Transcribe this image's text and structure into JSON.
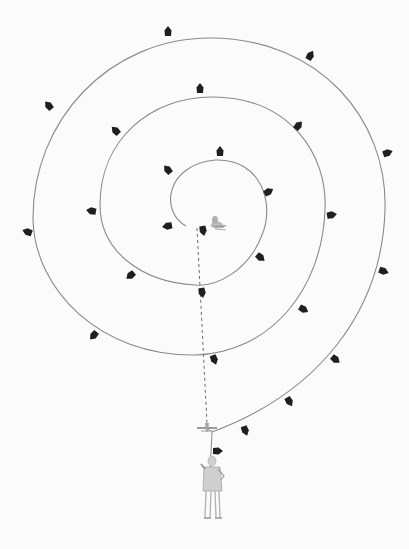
{
  "colors": {
    "background": "#fbfbfb",
    "spiral_line": "#8a8a8a",
    "marker": "#1f1f1f",
    "dotted_line": "#6a6a6a",
    "figure": "#b9b9b9",
    "bird": "#a8a8a8"
  },
  "spiral": {
    "path": "M 186 226 C 160 212, 165 165, 215 160 C 262 158, 275 205, 262 235 C 248 272, 215 287, 195 285 C 140 282, 100 250, 100 205 C 100 140, 150 97, 212 97 C 290 97, 328 155, 325 210 C 322 290, 270 353, 195 355 C 100 356, 35 290, 33 220 C 32 120, 110 38, 210 38 C 320 38, 388 120, 385 210 C 382 310, 320 392, 212 432"
  },
  "markers": [
    {
      "x": 168,
      "y": 32,
      "r": 0
    },
    {
      "x": 310,
      "y": 56,
      "r": 30
    },
    {
      "x": 49,
      "y": 106,
      "r": -40
    },
    {
      "x": 200,
      "y": 89,
      "r": 0
    },
    {
      "x": 116,
      "y": 131,
      "r": -45
    },
    {
      "x": 298,
      "y": 126,
      "r": 40
    },
    {
      "x": 387,
      "y": 153,
      "r": 70
    },
    {
      "x": 220,
      "y": 152,
      "r": 0
    },
    {
      "x": 168,
      "y": 170,
      "r": -40
    },
    {
      "x": 268,
      "y": 192,
      "r": 60
    },
    {
      "x": 92,
      "y": 211,
      "r": -80
    },
    {
      "x": 28,
      "y": 232,
      "r": -70
    },
    {
      "x": 331,
      "y": 215,
      "r": 80
    },
    {
      "x": 168,
      "y": 226,
      "r": -100
    },
    {
      "x": 203,
      "y": 230,
      "r": 170
    },
    {
      "x": 260,
      "y": 257,
      "r": 130
    },
    {
      "x": 383,
      "y": 271,
      "r": 110
    },
    {
      "x": 131,
      "y": 275,
      "r": -130
    },
    {
      "x": 202,
      "y": 292,
      "r": 170
    },
    {
      "x": 303,
      "y": 309,
      "r": 120
    },
    {
      "x": 94,
      "y": 335,
      "r": -140
    },
    {
      "x": 214,
      "y": 359,
      "r": 160
    },
    {
      "x": 335,
      "y": 359,
      "r": 130
    },
    {
      "x": 289,
      "y": 401,
      "r": 150
    },
    {
      "x": 245,
      "y": 430,
      "r": 160
    },
    {
      "x": 217,
      "y": 451,
      "r": 90
    }
  ],
  "bird": {
    "x": 217,
    "y": 225
  },
  "small_bird": {
    "x": 207,
    "y": 428
  },
  "dotted_line": {
    "x1": 197,
    "y1": 228,
    "x2": 207,
    "y2": 424
  },
  "figure": {
    "x": 212,
    "y": 488
  }
}
